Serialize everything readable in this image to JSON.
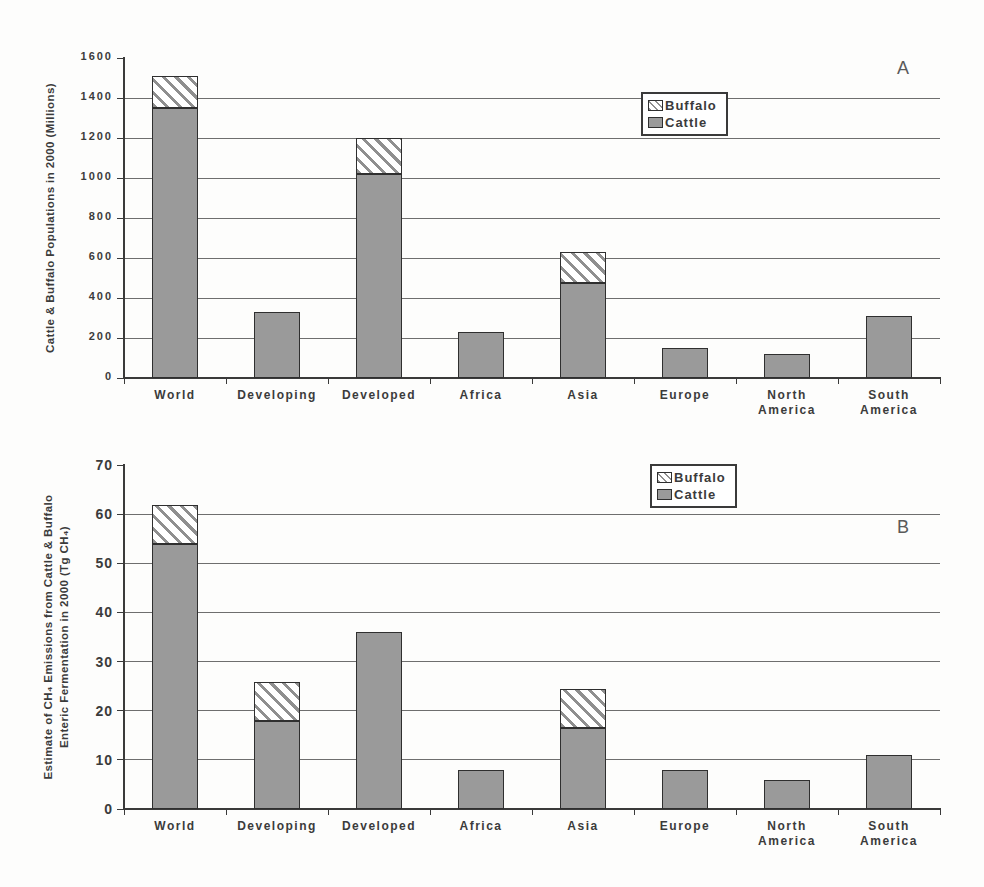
{
  "page": {
    "background": "#fdfdfc"
  },
  "colors": {
    "cattle_fill": "#9a9a9a",
    "bar_border": "#2f2f2f",
    "hatch_stripe": "#8f8f8f",
    "hatch_bg": "#ffffff",
    "axis": "#3a3a3a",
    "gridline": "#6e6e6e",
    "text": "#3b3b3b",
    "legend_bg": "#ffffff"
  },
  "chart_data": [
    {
      "type": "bar",
      "stacked": true,
      "panel_label": "A",
      "ylabel": "Cattle & Buffalo Populations in 2000 (Millions)",
      "ylabel_lines": [
        "Cattle & Buffalo Populations in 2000 (Millions)"
      ],
      "xlabel": "",
      "categories": [
        "World",
        "Developing",
        "Developed",
        "Africa",
        "Asia",
        "Europe",
        "North\nAmerica",
        "South\nAmerica"
      ],
      "series": [
        {
          "name": "Cattle",
          "values": [
            1350,
            330,
            1020,
            230,
            475,
            150,
            120,
            310
          ]
        },
        {
          "name": "Buffalo",
          "values": [
            160,
            0,
            180,
            0,
            155,
            0,
            0,
            0
          ]
        }
      ],
      "ylim": [
        0,
        1600
      ],
      "ytick_step": 200,
      "ytick_labels": [
        "0",
        "200",
        "400",
        "600",
        "800",
        "1000",
        "1200",
        "1400",
        "1600"
      ],
      "grid": "horizontal",
      "legend": [
        "Buffalo",
        "Cattle"
      ],
      "legend_position": "inside-top-right"
    },
    {
      "type": "bar",
      "stacked": true,
      "panel_label": "B",
      "ylabel": "Estimate of CH₄ Emissions from Cattle & Buffalo Enteric Fermentation in 2000 (Tg CH₄)",
      "ylabel_lines": [
        "Estimate of CH₄ Emissions from Cattle & Buffalo",
        "Enteric Fermentation in 2000 (Tg CH₄)"
      ],
      "xlabel": "",
      "categories": [
        "World",
        "Developing",
        "Developed",
        "Africa",
        "Asia",
        "Europe",
        "North\nAmerica",
        "South\nAmerica"
      ],
      "series": [
        {
          "name": "Cattle",
          "values": [
            54,
            18,
            36,
            8,
            16.5,
            8,
            6,
            11
          ]
        },
        {
          "name": "Buffalo",
          "values": [
            8,
            8,
            0,
            0,
            8,
            0,
            0,
            0
          ]
        }
      ],
      "ylim": [
        0,
        70
      ],
      "ytick_step": 10,
      "ytick_labels": [
        "0",
        "10",
        "20",
        "30",
        "40",
        "50",
        "60",
        "70"
      ],
      "grid": "horizontal",
      "legend": [
        "Buffalo",
        "Cattle"
      ],
      "legend_position": "inside-top-right"
    }
  ]
}
